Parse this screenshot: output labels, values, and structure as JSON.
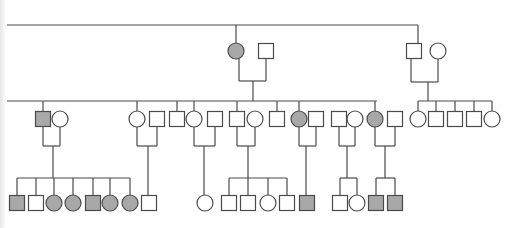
{
  "diagram": {
    "type": "pedigree",
    "colors": {
      "line": "#4a4a4a",
      "affected": "#a8a8a8",
      "unaffected": "#ffffff"
    },
    "symbol_size": 15,
    "legend": {
      "square": "male",
      "circle": "female",
      "filled": "affected",
      "open": "unaffected"
    }
  },
  "lines": [
    [
      7,
      25,
      418,
      25
    ],
    [
      236,
      25,
      236,
      43
    ],
    [
      418,
      25,
      418,
      43
    ],
    [
      239,
      59,
      239,
      81
    ],
    [
      266,
      59,
      266,
      81
    ],
    [
      239,
      81,
      266,
      81
    ],
    [
      253,
      81,
      253,
      101
    ],
    [
      411,
      59,
      411,
      82
    ],
    [
      438,
      59,
      438,
      82
    ],
    [
      411,
      82,
      438,
      82
    ],
    [
      428,
      82,
      428,
      101
    ],
    [
      7,
      101,
      377,
      101
    ],
    [
      43,
      101,
      43,
      111
    ],
    [
      137,
      101,
      137,
      111
    ],
    [
      177,
      101,
      177,
      111
    ],
    [
      194,
      101,
      194,
      111
    ],
    [
      237,
      101,
      237,
      111
    ],
    [
      277,
      101,
      277,
      111
    ],
    [
      299,
      101,
      299,
      111
    ],
    [
      375,
      101,
      375,
      111
    ],
    [
      418,
      101,
      492,
      101
    ],
    [
      418,
      101,
      418,
      111
    ],
    [
      436,
      101,
      436,
      111
    ],
    [
      455,
      101,
      455,
      111
    ],
    [
      474,
      101,
      474,
      111
    ],
    [
      492,
      101,
      492,
      111
    ],
    [
      43,
      127,
      43,
      146
    ],
    [
      60,
      127,
      60,
      146
    ],
    [
      43,
      146,
      60,
      146
    ],
    [
      53,
      146,
      53,
      178
    ],
    [
      137,
      127,
      137,
      146
    ],
    [
      157,
      127,
      157,
      146
    ],
    [
      137,
      146,
      157,
      146
    ],
    [
      148,
      146,
      148,
      195
    ],
    [
      194,
      127,
      194,
      146
    ],
    [
      215,
      127,
      215,
      146
    ],
    [
      194,
      146,
      215,
      146
    ],
    [
      204,
      146,
      204,
      195
    ],
    [
      237,
      127,
      237,
      146
    ],
    [
      255,
      127,
      255,
      146
    ],
    [
      237,
      146,
      255,
      146
    ],
    [
      248,
      146,
      248,
      178
    ],
    [
      299,
      127,
      299,
      146
    ],
    [
      316,
      127,
      316,
      146
    ],
    [
      299,
      146,
      316,
      146
    ],
    [
      306,
      146,
      306,
      195
    ],
    [
      339,
      127,
      339,
      146
    ],
    [
      355,
      127,
      355,
      146
    ],
    [
      339,
      146,
      355,
      146
    ],
    [
      347,
      146,
      347,
      178
    ],
    [
      375,
      127,
      375,
      146
    ],
    [
      395,
      127,
      395,
      146
    ],
    [
      375,
      146,
      395,
      146
    ],
    [
      385,
      146,
      385,
      178
    ],
    [
      17,
      178,
      130,
      178
    ],
    [
      17,
      178,
      17,
      195
    ],
    [
      36,
      178,
      36,
      195
    ],
    [
      54,
      178,
      54,
      195
    ],
    [
      73,
      178,
      73,
      195
    ],
    [
      93,
      178,
      93,
      195
    ],
    [
      110,
      178,
      110,
      195
    ],
    [
      130,
      178,
      130,
      195
    ],
    [
      229,
      178,
      287,
      178
    ],
    [
      229,
      178,
      229,
      195
    ],
    [
      248,
      178,
      248,
      195
    ],
    [
      268,
      178,
      268,
      195
    ],
    [
      287,
      178,
      287,
      195
    ],
    [
      340,
      178,
      357,
      178
    ],
    [
      340,
      178,
      340,
      195
    ],
    [
      357,
      178,
      357,
      195
    ],
    [
      376,
      178,
      395,
      178
    ],
    [
      376,
      178,
      376,
      195
    ],
    [
      395,
      178,
      395,
      195
    ]
  ],
  "generations": [
    {
      "label": "I",
      "individuals": [
        {
          "id": "I-1",
          "sex": "female",
          "affected": true,
          "x": 236,
          "y": 51
        },
        {
          "id": "I-2",
          "sex": "male",
          "affected": false,
          "x": 266,
          "y": 51
        },
        {
          "id": "I-3",
          "sex": "male",
          "affected": false,
          "x": 414,
          "y": 51
        },
        {
          "id": "I-4",
          "sex": "female",
          "affected": false,
          "x": 438,
          "y": 51
        }
      ]
    },
    {
      "label": "II",
      "individuals": [
        {
          "id": "II-1",
          "sex": "male",
          "affected": true,
          "x": 43,
          "y": 119
        },
        {
          "id": "II-2",
          "sex": "female",
          "affected": false,
          "x": 60,
          "y": 119
        },
        {
          "id": "II-3",
          "sex": "female",
          "affected": false,
          "x": 137,
          "y": 119
        },
        {
          "id": "II-4",
          "sex": "male",
          "affected": false,
          "x": 157,
          "y": 119
        },
        {
          "id": "II-5",
          "sex": "male",
          "affected": false,
          "x": 177,
          "y": 119
        },
        {
          "id": "II-6",
          "sex": "female",
          "affected": false,
          "x": 194,
          "y": 119
        },
        {
          "id": "II-7",
          "sex": "male",
          "affected": false,
          "x": 215,
          "y": 119
        },
        {
          "id": "II-8",
          "sex": "male",
          "affected": false,
          "x": 237,
          "y": 119
        },
        {
          "id": "II-9",
          "sex": "female",
          "affected": false,
          "x": 255,
          "y": 119
        },
        {
          "id": "II-10",
          "sex": "male",
          "affected": false,
          "x": 277,
          "y": 119
        },
        {
          "id": "II-11",
          "sex": "female",
          "affected": true,
          "x": 299,
          "y": 119
        },
        {
          "id": "II-12",
          "sex": "male",
          "affected": false,
          "x": 316,
          "y": 119
        },
        {
          "id": "II-13",
          "sex": "male",
          "affected": false,
          "x": 339,
          "y": 119
        },
        {
          "id": "II-14",
          "sex": "female",
          "affected": false,
          "x": 355,
          "y": 119
        },
        {
          "id": "II-15",
          "sex": "female",
          "affected": true,
          "x": 375,
          "y": 119
        },
        {
          "id": "II-16",
          "sex": "male",
          "affected": false,
          "x": 395,
          "y": 119
        },
        {
          "id": "II-17",
          "sex": "female",
          "affected": false,
          "x": 418,
          "y": 119
        },
        {
          "id": "II-18",
          "sex": "male",
          "affected": false,
          "x": 436,
          "y": 119
        },
        {
          "id": "II-19",
          "sex": "male",
          "affected": false,
          "x": 455,
          "y": 119
        },
        {
          "id": "II-20",
          "sex": "male",
          "affected": false,
          "x": 474,
          "y": 119
        },
        {
          "id": "II-21",
          "sex": "female",
          "affected": false,
          "x": 492,
          "y": 119
        }
      ]
    },
    {
      "label": "III",
      "individuals": [
        {
          "id": "III-1",
          "sex": "male",
          "affected": true,
          "x": 17,
          "y": 203
        },
        {
          "id": "III-2",
          "sex": "male",
          "affected": false,
          "x": 36,
          "y": 203
        },
        {
          "id": "III-3",
          "sex": "female",
          "affected": true,
          "x": 54,
          "y": 203
        },
        {
          "id": "III-4",
          "sex": "female",
          "affected": true,
          "x": 73,
          "y": 203
        },
        {
          "id": "III-5",
          "sex": "male",
          "affected": true,
          "x": 93,
          "y": 203
        },
        {
          "id": "III-6",
          "sex": "female",
          "affected": true,
          "x": 110,
          "y": 203
        },
        {
          "id": "III-7",
          "sex": "female",
          "affected": true,
          "x": 130,
          "y": 203
        },
        {
          "id": "III-8",
          "sex": "male",
          "affected": false,
          "x": 149,
          "y": 203
        },
        {
          "id": "III-9",
          "sex": "female",
          "affected": false,
          "x": 205,
          "y": 203
        },
        {
          "id": "III-10",
          "sex": "male",
          "affected": false,
          "x": 229,
          "y": 203
        },
        {
          "id": "III-11",
          "sex": "male",
          "affected": false,
          "x": 248,
          "y": 203
        },
        {
          "id": "III-12",
          "sex": "female",
          "affected": false,
          "x": 268,
          "y": 203
        },
        {
          "id": "III-13",
          "sex": "male",
          "affected": false,
          "x": 287,
          "y": 203
        },
        {
          "id": "III-14",
          "sex": "male",
          "affected": true,
          "x": 307,
          "y": 203
        },
        {
          "id": "III-15",
          "sex": "male",
          "affected": false,
          "x": 340,
          "y": 203
        },
        {
          "id": "III-16",
          "sex": "female",
          "affected": false,
          "x": 357,
          "y": 203
        },
        {
          "id": "III-17",
          "sex": "male",
          "affected": true,
          "x": 376,
          "y": 203
        },
        {
          "id": "III-18",
          "sex": "male",
          "affected": true,
          "x": 395,
          "y": 203
        }
      ]
    }
  ]
}
